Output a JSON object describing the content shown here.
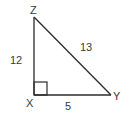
{
  "diagram": {
    "type": "right-triangle",
    "vertices": {
      "Z": {
        "label": "Z",
        "x": 34,
        "y": 17
      },
      "X": {
        "label": "X",
        "x": 34,
        "y": 95
      },
      "Y": {
        "label": "Y",
        "x": 111,
        "y": 95
      }
    },
    "right_angle_at": "X",
    "sides": {
      "XZ": {
        "label": "12"
      },
      "ZY": {
        "label": "13"
      },
      "XY": {
        "label": "5"
      }
    },
    "colors": {
      "stroke": "#2b2b2b",
      "text": "#3a3a3a",
      "background": "#ffffff"
    }
  }
}
